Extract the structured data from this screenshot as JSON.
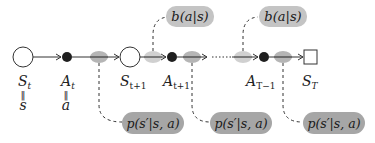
{
  "colors": {
    "state_fill": "#ffffff",
    "stroke": "#333333",
    "action_fill": "#1f1f1f",
    "policy_ellipse": "#c8c8c8",
    "transition_ellipse": "#a8a8a8",
    "policy_pill": "#c4c4c4",
    "transition_pill": "#a6a6a6"
  },
  "nodes": {
    "s_t": {
      "label": "S",
      "sub": "t",
      "eq": "s"
    },
    "a_t": {
      "label": "A",
      "sub": "t",
      "eq": "a"
    },
    "s_t1": {
      "label": "S",
      "sub": "t+1"
    },
    "a_t1": {
      "label": "A",
      "sub": "t+1"
    },
    "a_T1": {
      "label": "A",
      "sub": "T−1"
    },
    "s_T": {
      "label": "S",
      "sub": "T"
    }
  },
  "equals_sign": "‖",
  "annotations": {
    "policy": [
      {
        "text": "b(a|s)"
      },
      {
        "text": "b(a|s)"
      }
    ],
    "transition": [
      {
        "text": "p(s′|s, a)"
      },
      {
        "text": "p(s′|s, a)"
      },
      {
        "text": "p(s′|s, a)"
      }
    ]
  }
}
